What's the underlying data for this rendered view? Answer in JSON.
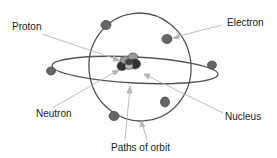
{
  "diagram": {
    "type": "atom-structure",
    "labels": {
      "proton": "Proton",
      "electron": "Electron",
      "neutron": "Neutron",
      "nucleus": "Nucleus",
      "paths_of_orbit": "Paths of orbit"
    },
    "colors": {
      "background": "#ffffff",
      "orbit": "#555555",
      "electron": "#666666",
      "electron_stroke": "#444444",
      "proton": "#9a9a9a",
      "neutron": "#333333",
      "leader_line": "#b5b5b5",
      "text": "#222222"
    },
    "electron_count": 6,
    "orbit_count": 2
  }
}
